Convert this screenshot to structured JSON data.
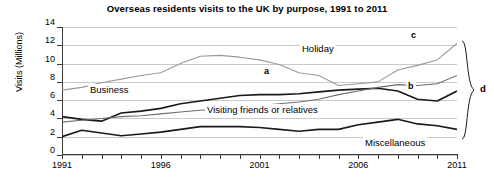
{
  "chart_data": {
    "type": "line",
    "title": "Overseas residents visits to the UK by purpose, 1991 to 2011",
    "xlabel": "",
    "ylabel": "Visits (Millions)",
    "xlim": [
      1991,
      2011
    ],
    "ylim": [
      0,
      14
    ],
    "ytick_labels": [
      "0",
      "2",
      "4",
      "6",
      "8",
      "10",
      "12",
      "14"
    ],
    "ytick_values": [
      0,
      2,
      4,
      6,
      8,
      10,
      12,
      14
    ],
    "xtick_labels": [
      "1991",
      "1996",
      "2001",
      "2006",
      "2011"
    ],
    "xtick_values": [
      1991,
      1996,
      2001,
      2006,
      2011
    ],
    "grid": true,
    "legend": "inline-labels",
    "x": [
      1991,
      1992,
      1993,
      1994,
      1995,
      1996,
      1997,
      1998,
      1999,
      2000,
      2001,
      2002,
      2003,
      2004,
      2005,
      2006,
      2007,
      2008,
      2009,
      2010,
      2011
    ],
    "series": [
      {
        "name": "Holiday",
        "color": "#9a9a9a",
        "values": [
          7.1,
          7.4,
          7.9,
          8.3,
          8.7,
          9.0,
          10.0,
          10.8,
          10.9,
          10.7,
          10.4,
          9.9,
          9.0,
          8.7,
          7.6,
          7.8,
          8.0,
          9.3,
          9.8,
          10.4,
          12.2
        ]
      },
      {
        "name": "Business",
        "color": "#1a1a1a",
        "values": [
          4.2,
          3.9,
          3.7,
          4.6,
          4.8,
          5.1,
          5.6,
          5.9,
          6.2,
          6.5,
          6.6,
          6.6,
          6.7,
          6.9,
          7.1,
          7.2,
          7.3,
          7.0,
          6.1,
          5.9,
          7.0
        ]
      },
      {
        "name": "Visiting friends or relatives",
        "color": "#6e6e6e",
        "values": [
          3.6,
          3.8,
          4.0,
          4.2,
          4.3,
          4.5,
          4.7,
          4.9,
          5.0,
          5.2,
          5.4,
          5.6,
          5.8,
          6.1,
          6.6,
          7.0,
          7.4,
          7.7,
          7.6,
          7.8,
          8.7
        ]
      },
      {
        "name": "Miscellaneous",
        "color": "#1a1a1a",
        "values": [
          2.0,
          2.7,
          2.4,
          2.1,
          2.3,
          2.5,
          2.8,
          3.1,
          3.1,
          3.1,
          3.0,
          2.8,
          2.6,
          2.8,
          2.8,
          3.3,
          3.6,
          3.9,
          3.4,
          3.2,
          2.8
        ]
      }
    ],
    "inline_labels": [
      {
        "text": "Holiday",
        "x": 300,
        "y": 43
      },
      {
        "text": "Business",
        "x": 88,
        "y": 84
      },
      {
        "text": "Visiting friends or relatives",
        "x": 205,
        "y": 104
      },
      {
        "text": "Miscellaneous",
        "x": 363,
        "y": 137
      }
    ],
    "annotations": [
      {
        "text": "a",
        "x": 262,
        "y": 66
      },
      {
        "text": "b",
        "x": 406,
        "y": 81
      },
      {
        "text": "c",
        "x": 409,
        "y": 30
      },
      {
        "text": "d",
        "x": 480,
        "y": 83
      }
    ]
  }
}
